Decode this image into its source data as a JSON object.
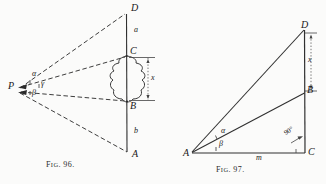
{
  "page": {
    "background_color": "#fbfbfa",
    "ink_color": "#222222",
    "width": 326,
    "height": 184
  },
  "figures": [
    {
      "id": "fig-96",
      "caption_prefix": "F",
      "caption_ig": "IG",
      "caption_number": ". 96.",
      "caption_full": "Fig. 96.",
      "description": "observer at P sighting a vertical staff A-B-C-D with a tree between B and C",
      "points": [
        {
          "name": "P",
          "label": "P",
          "x": 10,
          "y": 87
        },
        {
          "name": "D",
          "label": "D",
          "x": 131,
          "y": 10
        },
        {
          "name": "C",
          "label": "C",
          "x": 130,
          "y": 54
        },
        {
          "name": "B",
          "label": "B",
          "x": 130,
          "y": 104
        },
        {
          "name": "A",
          "label": "A",
          "x": 132,
          "y": 157
        }
      ],
      "segment_labels": [
        {
          "name": "segment-a",
          "label": "a",
          "x": 134,
          "y": 30
        },
        {
          "name": "segment-x",
          "label": "x",
          "x": 150,
          "y": 77
        },
        {
          "name": "segment-b",
          "label": "b",
          "x": 134,
          "y": 131
        }
      ],
      "angle_labels": [
        {
          "name": "angle-alpha",
          "label": "α",
          "x": 33,
          "y": 74
        },
        {
          "name": "angle-gamma",
          "label": "γ",
          "x": 42,
          "y": 83
        },
        {
          "name": "angle-beta",
          "label": "β",
          "x": 33,
          "y": 92
        }
      ]
    },
    {
      "id": "fig-97",
      "caption_prefix": "F",
      "caption_ig": "IG",
      "caption_number": ". 97.",
      "caption_full": "Fig. 97.",
      "description": "right triangle A C D with point B on side D C, base m and height x",
      "points": [
        {
          "name": "A",
          "label": "A",
          "x": 186,
          "y": 152
        },
        {
          "name": "C",
          "label": "C",
          "x": 310,
          "y": 152
        },
        {
          "name": "B",
          "label": "B",
          "x": 309,
          "y": 90
        },
        {
          "name": "D",
          "label": "D",
          "x": 303,
          "y": 27
        }
      ],
      "segment_labels": [
        {
          "name": "segment-m",
          "label": "m",
          "x": 259,
          "y": 149
        },
        {
          "name": "segment-x",
          "label": "x",
          "x": 310,
          "y": 59
        }
      ],
      "angle_labels": [
        {
          "name": "angle-alpha",
          "label": "α",
          "x": 223,
          "y": 131
        },
        {
          "name": "angle-beta",
          "label": "β",
          "x": 221,
          "y": 143
        },
        {
          "name": "angle-right",
          "label": "90°",
          "x": 288,
          "y": 134
        }
      ]
    }
  ]
}
